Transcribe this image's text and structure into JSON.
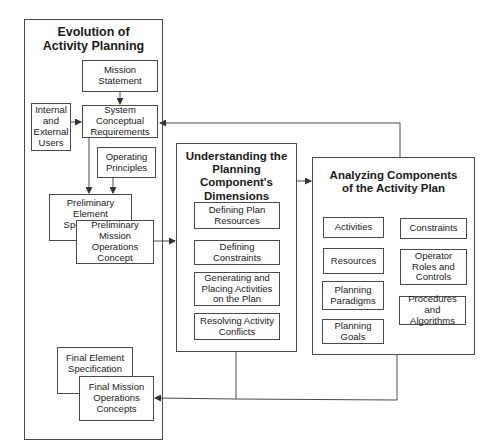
{
  "evolution": {
    "title": "Evolution of\nActivity Planning",
    "mission_statement": "Mission\nStatement",
    "internal_external_users": "Internal\nand\nExternal\nUsers",
    "system_conceptual_requirements": "System\nConceptual\nRequirements",
    "operating_principles": "Operating\nPrinciples",
    "preliminary_element_specification": "Preliminary Element\nSpecification",
    "preliminary_mission_operations_concept": "Preliminary\nMission Operations\nConcept",
    "final_element_specification": "Final Element\nSpecification",
    "final_mission_operations_concepts": "Final Mission\nOperations\nConcepts"
  },
  "understanding": {
    "title": "Understanding the\nPlanning Component's\nDimensions",
    "items": [
      "Defining Plan\nResources",
      "Defining Constraints",
      "Generating and\nPlacing Activities\non the Plan",
      "Resolving Activity\nConflicts"
    ]
  },
  "analyzing": {
    "title": "Analyzing Components\nof the Activity Plan",
    "left_items": [
      "Activities",
      "Resources",
      "Planning\nParadigms",
      "Planning\nGoals"
    ],
    "right_items": [
      "Constraints",
      "Operator\nRoles and\nControls",
      "Procedures and\nAlgorithms"
    ]
  },
  "colors": {
    "line": "#4a4a4a",
    "background": "#ffffff"
  }
}
